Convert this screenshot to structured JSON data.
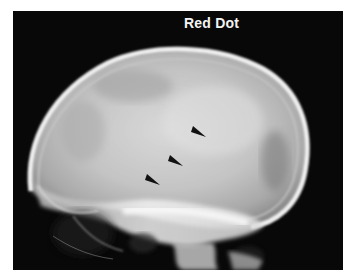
{
  "figure": {
    "label": "Red Dot",
    "arrowheads": [
      {
        "name": "arrowhead-upper",
        "tip": [
          206,
          137
        ]
      },
      {
        "name": "arrowhead-middle",
        "tip": [
          183,
          166
        ]
      },
      {
        "name": "arrowhead-lower",
        "tip": [
          160,
          185
        ]
      }
    ],
    "colors": {
      "background": "#080808",
      "border": "#ffffff",
      "label": "#f4f4f4",
      "bone": "#e8e8e8",
      "arrowhead": "#111111"
    }
  }
}
